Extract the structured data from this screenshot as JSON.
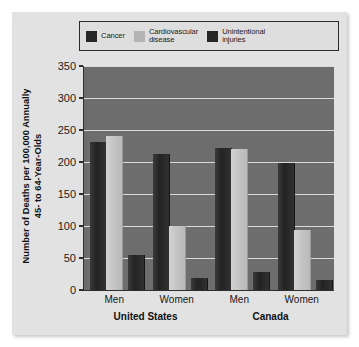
{
  "chart_data": {
    "type": "bar",
    "title": "",
    "subtitle": "",
    "xlabel": "",
    "ylabel": "Number of Deaths per 100,000 Annually\n45- to 64-Year-Olds",
    "ylim": [
      0,
      350
    ],
    "yticks": [
      0,
      50,
      100,
      150,
      200,
      250,
      300,
      350
    ],
    "ytick_labels": [
      "0",
      "50",
      "100",
      "150",
      "200",
      "250",
      "300",
      "350"
    ],
    "grid": true,
    "legend_position": "top",
    "categories": [
      "Men",
      "Women",
      "Men",
      "Women"
    ],
    "groups": [
      {
        "name": "United States",
        "categories": [
          "Men",
          "Women"
        ]
      },
      {
        "name": "Canada",
        "categories": [
          "Men",
          "Women"
        ]
      }
    ],
    "series": [
      {
        "name": "Cancer",
        "color": "#262626",
        "values": [
          232,
          213,
          222,
          199
        ]
      },
      {
        "name": "Cardiovascular disease",
        "color": "#c4c4c4",
        "values": [
          240,
          100,
          220,
          93
        ]
      },
      {
        "name": "Unintentional injuries",
        "color": "#262626",
        "values": [
          55,
          18,
          28,
          15
        ]
      }
    ],
    "points": [
      {
        "group": "United States",
        "category": "Men",
        "Cancer": 232,
        "Cardiovascular disease": 240,
        "Unintentional injuries": 55
      },
      {
        "group": "United States",
        "category": "Women",
        "Cancer": 213,
        "Cardiovascular disease": 100,
        "Unintentional injuries": 18
      },
      {
        "group": "Canada",
        "category": "Men",
        "Cancer": 222,
        "Cardiovascular disease": 220,
        "Unintentional injuries": 28
      },
      {
        "group": "Canada",
        "category": "Women",
        "Cancer": 199,
        "Cardiovascular disease": 93,
        "Unintentional injuries": 15
      }
    ]
  },
  "legend": {
    "items": [
      {
        "label": "Cancer",
        "color": "#262626"
      },
      {
        "label": "Cardiovascular\ndisease",
        "color": "#b4b4b4"
      },
      {
        "label": "Unintentional\ninjuries",
        "color": "#262626"
      }
    ]
  },
  "axes": {
    "y_title": "Number of Deaths per 100,000 Annually\n45- to 64-Year-Olds",
    "y_tick_labels": [
      "350",
      "300",
      "250",
      "200",
      "150",
      "100",
      "50",
      "0"
    ],
    "x_tick_labels": [
      "Men",
      "Women",
      "Men",
      "Women"
    ],
    "x_group_labels": [
      "United States",
      "Canada"
    ]
  },
  "colors": {
    "panel_background": "#e2e2e2",
    "plot_background": "#6d6d6d",
    "gridline": "#d9d9d9",
    "axis": "#2e2e2e",
    "dark_series": "#262626",
    "light_series": "#c4c4c4",
    "text": "#161616"
  }
}
